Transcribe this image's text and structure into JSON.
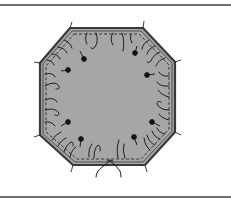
{
  "figure": {
    "colors": {
      "fill": "#a6a6a6",
      "outline": "#3a3a3a",
      "stitch": "#2a2a2a",
      "rule": "#6e6e6e",
      "background": "#ffffff"
    },
    "octagon_points": "70,28 143,28 175,62 175,132 145,165 73,165 40,135 40,63",
    "pins": [
      {
        "x": 84,
        "y": 59
      },
      {
        "x": 68,
        "y": 70
      },
      {
        "x": 135,
        "y": 53
      },
      {
        "x": 147,
        "y": 75
      },
      {
        "x": 68,
        "y": 122
      },
      {
        "x": 81,
        "y": 139
      },
      {
        "x": 134,
        "y": 137
      },
      {
        "x": 152,
        "y": 122
      }
    ]
  }
}
